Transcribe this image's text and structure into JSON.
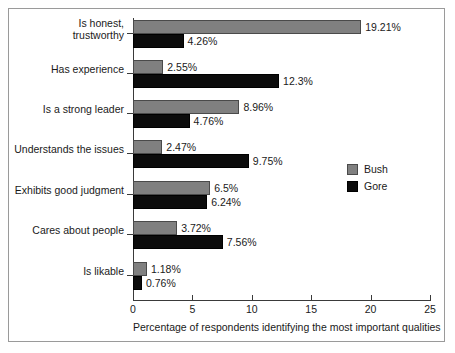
{
  "chart_data": {
    "type": "bar",
    "orientation": "horizontal",
    "title": "",
    "xlabel": "Percentage of respondents identifying the most important qualities",
    "ylabel": "",
    "xlim": [
      0,
      25
    ],
    "xticks": [
      0,
      5,
      10,
      15,
      20,
      25
    ],
    "xtick_labels": [
      "0",
      "5",
      "10",
      "15",
      "20",
      "25"
    ],
    "grid": false,
    "legend_position": "center-right",
    "categories": [
      "Is honest,\ntrustworthy",
      "Has experience",
      "Is a strong leader",
      "Understands the issues",
      "Exhibits good judgment",
      "Cares about people",
      "Is likable"
    ],
    "category_labels": [
      [
        "Is honest,",
        "trustworthy"
      ],
      [
        "Has experience"
      ],
      [
        "Is a strong leader"
      ],
      [
        "Understands the issues"
      ],
      [
        "Exhibits good judgment"
      ],
      [
        "Cares about people"
      ],
      [
        "Is likable"
      ]
    ],
    "series": [
      {
        "name": "Bush",
        "color": "#808080",
        "values": [
          19.21,
          2.55,
          8.96,
          2.47,
          6.5,
          3.72,
          1.18
        ],
        "value_labels": [
          "19.21%",
          "2.55%",
          "8.96%",
          "2.47%",
          "6.5%",
          "3.72%",
          "1.18%"
        ]
      },
      {
        "name": "Gore",
        "color": "#0c0c0c",
        "values": [
          4.26,
          12.3,
          4.76,
          9.75,
          6.24,
          7.56,
          0.76
        ],
        "value_labels": [
          "4.26%",
          "12.3%",
          "4.76%",
          "9.75%",
          "6.24%",
          "7.56%",
          "0.76%"
        ]
      }
    ]
  },
  "legend": {
    "items": [
      {
        "label": "Bush",
        "color": "#808080"
      },
      {
        "label": "Gore",
        "color": "#0c0c0c"
      }
    ]
  }
}
